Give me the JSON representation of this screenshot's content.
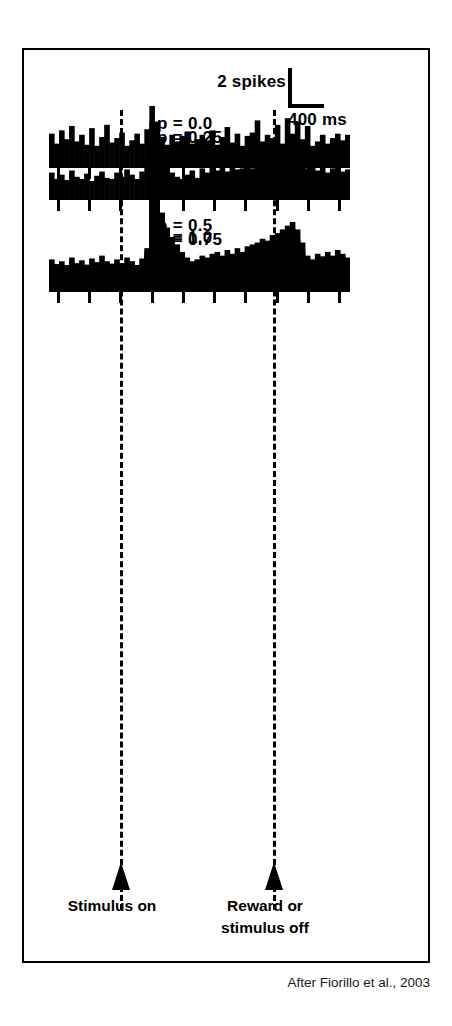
{
  "figure": {
    "citation": "After Fiorillo et al., 2003",
    "scale_bar": {
      "spikes_label": "2 spikes",
      "time_label": "400 ms",
      "spikes_value": 2,
      "time_value_ms": 400
    },
    "event_markers": [
      {
        "name": "stimulus-on",
        "caption": "Stimulus on",
        "x_fraction": 0.2368
      },
      {
        "name": "reward-or-stimulus-off",
        "caption_line1": "Reward or",
        "caption_line2": "stimulus off",
        "x_fraction": 0.745
      }
    ]
  },
  "chart_data": {
    "type": "bar",
    "xlabel": "Time",
    "ylabel": "Spikes",
    "grid": false,
    "legend": "none",
    "bin_width_ms": 20,
    "n_bins": 60,
    "x_range_ms": [
      -440,
      760
    ],
    "tick_count": 10,
    "tick_interval_ms": 120,
    "event_times_ms": {
      "stimulus_on": 0,
      "reward_or_stimulus_off": 620
    },
    "panels": [
      {
        "label": "p = 0.0",
        "probability": 0.0,
        "label_x": 108,
        "label_y": 8,
        "baseline_top": 56,
        "height": 62,
        "values": [
          3.1,
          2.2,
          3.4,
          2.6,
          3.8,
          2.4,
          3.0,
          2.1,
          3.6,
          2.0,
          2.8,
          3.9,
          2.3,
          2.7,
          3.2,
          2.0,
          2.5,
          3.1,
          2.2,
          3.5,
          5.6,
          4.2,
          2.8,
          2.1,
          3.0,
          2.4,
          2.9,
          3.3,
          2.2,
          2.6,
          3.0,
          2.5,
          3.4,
          2.1,
          2.8,
          3.7,
          2.3,
          3.1,
          2.0,
          2.9,
          3.2,
          4.3,
          2.4,
          3.0,
          2.7,
          3.9,
          2.2,
          4.5,
          3.1,
          4.2,
          2.6,
          3.8,
          2.0,
          2.4,
          3.0,
          2.2,
          2.7,
          3.1,
          2.5,
          3.0
        ]
      },
      {
        "label": "p = 0.25",
        "probability": 0.25,
        "label_x": 108,
        "label_y": 6,
        "baseline_top": 72,
        "height": 78,
        "values": [
          2.6,
          2.0,
          2.4,
          1.9,
          2.8,
          2.2,
          2.0,
          2.5,
          1.8,
          2.3,
          2.7,
          2.1,
          2.0,
          2.6,
          2.2,
          2.9,
          2.4,
          2.0,
          2.7,
          3.2,
          7.4,
          5.2,
          4.0,
          3.1,
          2.6,
          2.2,
          2.0,
          2.4,
          2.8,
          2.1,
          3.0,
          2.6,
          3.2,
          2.8,
          3.1,
          2.7,
          3.3,
          2.9,
          3.0,
          3.4,
          3.0,
          3.6,
          3.2,
          3.8,
          3.4,
          4.0,
          4.6,
          5.2,
          4.4,
          3.6,
          3.2,
          3.0,
          3.4,
          2.8,
          3.2,
          2.6,
          3.0,
          3.3,
          2.7,
          2.9
        ]
      },
      {
        "label": "p = 0.5",
        "probability": 0.5,
        "label_x": 108,
        "label_y": 54,
        "baseline_top": 112,
        "height": 118,
        "values": [
          2.2,
          1.7,
          2.0,
          1.6,
          2.4,
          1.8,
          2.1,
          1.5,
          2.3,
          1.9,
          2.6,
          2.0,
          1.7,
          2.2,
          1.8,
          2.4,
          2.0,
          1.6,
          2.3,
          3.4,
          12.6,
          9.0,
          7.2,
          5.6,
          4.6,
          3.8,
          3.0,
          2.4,
          2.0,
          2.2,
          2.6,
          2.4,
          2.8,
          3.0,
          2.6,
          3.2,
          2.8,
          3.4,
          3.0,
          3.6,
          3.8,
          4.0,
          4.4,
          4.2,
          4.8,
          5.0,
          5.4,
          5.8,
          6.2,
          5.4,
          4.0,
          2.6,
          2.2,
          2.8,
          2.4,
          3.0,
          2.6,
          3.2,
          2.8,
          2.4
        ]
      },
      {
        "label": "p = 0.75",
        "probability": 0.75,
        "label_x": 108,
        "label_y": 64,
        "baseline_top": 116,
        "height": 122,
        "values": [
          2.4,
          1.8,
          2.2,
          1.6,
          2.6,
          2.0,
          1.7,
          2.3,
          1.9,
          2.5,
          2.1,
          1.8,
          2.4,
          2.0,
          2.2,
          1.9,
          2.6,
          2.1,
          2.4,
          3.6,
          12.0,
          9.4,
          6.6,
          5.0,
          3.8,
          2.8,
          2.2,
          1.8,
          2.4,
          2.0,
          2.6,
          2.2,
          2.8,
          2.4,
          3.0,
          2.6,
          3.2,
          2.8,
          3.4,
          3.0,
          3.8,
          3.4,
          4.0,
          3.6,
          4.2,
          3.8,
          4.6,
          5.2,
          5.8,
          4.8,
          3.6,
          2.8,
          2.4,
          3.0,
          2.6,
          3.2,
          2.8,
          2.4,
          3.0,
          2.6
        ]
      },
      {
        "label": "p = 1.0",
        "probability": 1.0,
        "label_x": 108,
        "label_y": 60,
        "baseline_top": 118,
        "height": 124,
        "values": [
          2.8,
          2.2,
          2.6,
          2.0,
          3.0,
          2.4,
          2.1,
          2.7,
          2.3,
          2.9,
          2.5,
          2.2,
          2.8,
          2.4,
          2.6,
          2.3,
          3.0,
          2.5,
          2.8,
          4.0,
          13.2,
          10.0,
          6.8,
          4.6,
          3.4,
          2.6,
          2.2,
          2.8,
          2.4,
          3.0,
          2.6,
          3.2,
          2.8,
          3.4,
          2.6,
          3.0,
          2.4,
          2.8,
          3.2,
          2.6,
          3.0,
          2.8,
          3.4,
          3.0,
          3.6,
          3.2,
          4.4,
          5.0,
          5.4,
          4.2,
          3.2,
          2.8,
          3.4,
          3.0,
          3.8,
          3.2,
          2.8,
          3.4,
          2.6,
          3.0
        ]
      }
    ]
  }
}
